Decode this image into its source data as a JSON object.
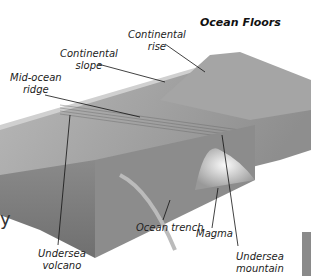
{
  "title": "Ocean Floors",
  "labels": {
    "continental_rise": [
      "Continental",
      "rise"
    ],
    "continental_slope": [
      "Continental",
      "slope"
    ],
    "mid_ocean_ridge": [
      "Mid-ocean",
      "ridge"
    ],
    "undersea_volcano": [
      "Undersea",
      "volcano"
    ],
    "ocean_trench": "Ocean trench",
    "magma": "Magma",
    "undersea_mountain": [
      "Undersea",
      "mountain"
    ]
  },
  "edge_fragment": "y"
}
